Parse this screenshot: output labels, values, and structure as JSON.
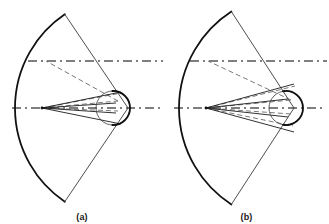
{
  "figure": {
    "panels": [
      {
        "id": "a",
        "caption": "(a)",
        "colors": {
          "primary_stroke": "#111111",
          "thin_stroke": "#3a3a3a",
          "axis_stroke": "#555555",
          "ray_stroke": "#6a6a6a"
        },
        "geometry": {
          "focus": {
            "x": 42,
            "y": 108
          },
          "main_arc": {
            "center_x": 128,
            "center_y": 108,
            "radius": 113,
            "start_angle_deg": -56,
            "end_angle_deg": 56,
            "line_width": 1.8
          },
          "sector_edges": [
            {
              "from_x": 128,
              "from_y": 108,
              "to_x": 80,
              "to_y": 16
            },
            {
              "from_x": 128,
              "from_y": 108,
              "to_x": 80,
              "to_y": 200
            }
          ],
          "small_circle": {
            "center_x": 113,
            "center_y": 108,
            "radius": 17,
            "bold_arc_start_deg": -92,
            "bold_arc_end_deg": 92
          },
          "axis_horizontal": {
            "y": 108,
            "x_start": 12,
            "x_end": 160,
            "style": "dash-dot"
          },
          "axis_upper": {
            "y": 61,
            "x_start": 28,
            "x_end": 163,
            "style": "dash-dot"
          },
          "cone_rays": [
            {
              "x2": 121,
              "y2": 92
            },
            {
              "x2": 121,
              "y2": 124
            },
            {
              "x2": 116,
              "y2": 103
            },
            {
              "x2": 116,
              "y2": 113
            }
          ],
          "dashed_rays": [
            {
              "x1": 42,
              "y1": 108,
              "x2": 121,
              "y2": 93
            },
            {
              "x1": 42,
              "y1": 108,
              "x2": 118,
              "y2": 101
            },
            {
              "x1": 42,
              "y1": 108,
              "x2": 118,
              "y2": 111
            },
            {
              "x1": 118,
              "y1": 101,
              "x2": 46,
              "y2": 61
            }
          ]
        }
      },
      {
        "id": "b",
        "caption": "(b)",
        "colors": {
          "primary_stroke": "#111111",
          "thin_stroke": "#3a3a3a",
          "axis_stroke": "#555555",
          "ray_stroke": "#6a6a6a"
        },
        "geometry": {
          "focus": {
            "x": 42,
            "y": 108
          },
          "main_arc": {
            "center_x": 130,
            "center_y": 108,
            "radius": 115,
            "start_angle_deg": -57,
            "end_angle_deg": 57,
            "line_width": 1.8
          },
          "sector_edges": [
            {
              "from_x": 130,
              "from_y": 108,
              "to_x": 82,
              "to_y": 14
            },
            {
              "from_x": 130,
              "from_y": 108,
              "to_x": 82,
              "to_y": 202
            }
          ],
          "small_circle": {
            "center_x": 122,
            "center_y": 108,
            "radius": 17,
            "bold_arc_start_deg": -100,
            "bold_arc_end_deg": 100
          },
          "axis_horizontal": {
            "y": 108,
            "x_start": 10,
            "x_end": 162,
            "style": "dash-dot"
          },
          "axis_upper": {
            "y": 61,
            "x_start": 26,
            "x_end": 163,
            "style": "dash-dot"
          },
          "cone_rays": [
            {
              "x2": 130,
              "y2": 84
            },
            {
              "x2": 130,
              "y2": 132
            },
            {
              "x2": 124,
              "y2": 99
            },
            {
              "x2": 124,
              "y2": 117
            }
          ],
          "dashed_rays": [
            {
              "x1": 42,
              "y1": 108,
              "x2": 131,
              "y2": 86
            },
            {
              "x1": 42,
              "y1": 108,
              "x2": 127,
              "y2": 100
            },
            {
              "x1": 42,
              "y1": 108,
              "x2": 127,
              "y2": 114
            },
            {
              "x1": 42,
              "y1": 108,
              "x2": 129,
              "y2": 126
            },
            {
              "x1": 127,
              "y1": 100,
              "x2": 44,
              "y2": 61
            }
          ]
        }
      }
    ]
  }
}
